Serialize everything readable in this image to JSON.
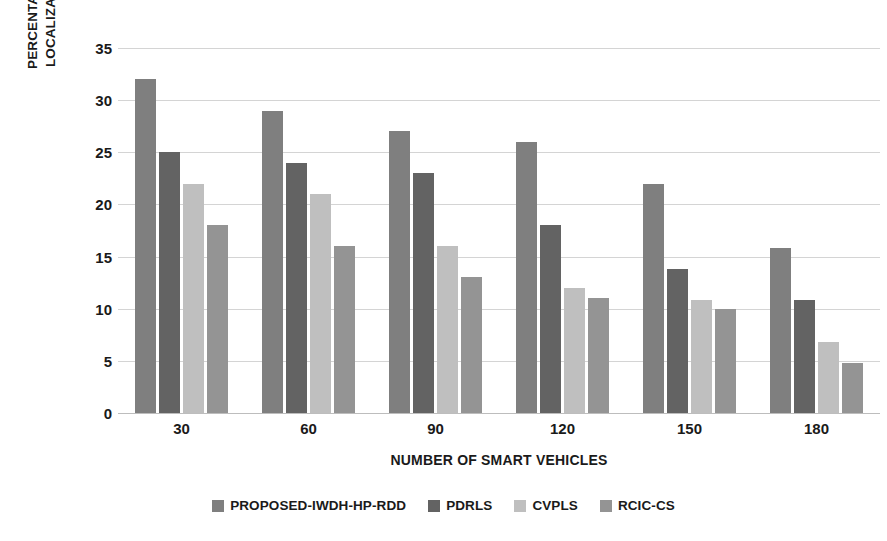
{
  "chart_data": {
    "type": "bar",
    "title": "",
    "xlabel": "NUMBER OF SMART VEHICLES",
    "ylabel_line1": "PERCENTAGE INCREASE IN",
    "ylabel_line2": "LOCALIZATION ACCURACY",
    "ylabel": "PERCENTAGE INCREASE IN LOCALIZATION ACCURACY",
    "categories": [
      "30",
      "60",
      "90",
      "120",
      "150",
      "180"
    ],
    "ylim": [
      0,
      35
    ],
    "yticks": [
      "35",
      "30",
      "25",
      "20",
      "15",
      "10",
      "5",
      "0"
    ],
    "ytick_values": [
      35,
      30,
      25,
      20,
      15,
      10,
      5,
      0
    ],
    "grid": "horizontal",
    "legend_position": "bottom",
    "series": [
      {
        "name": "PROPOSED-IWDH-HP-RDD",
        "color": "#7f7f7f",
        "values": [
          32,
          29,
          27,
          26,
          22,
          15.8
        ]
      },
      {
        "name": "PDRLS",
        "color": "#636363",
        "values": [
          25,
          24,
          23,
          18,
          13.8,
          10.8
        ]
      },
      {
        "name": "CVPLS",
        "color": "#bfbfbf",
        "values": [
          22,
          21,
          16,
          12,
          10.8,
          6.8
        ]
      },
      {
        "name": "RCIC-CS",
        "color": "#949494",
        "values": [
          18,
          16,
          13,
          11,
          10,
          4.8
        ]
      }
    ]
  }
}
